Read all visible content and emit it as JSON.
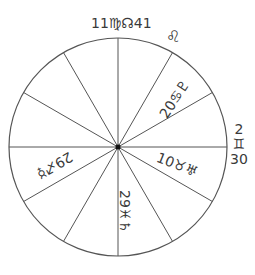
{
  "chart": {
    "center": [
      118,
      147
    ],
    "radius": 109,
    "spoke_count": 12,
    "line_color": "#555555"
  },
  "labels": {
    "top": "11♍☊41",
    "top_right_sign": "♌",
    "upper_right_sector": "20♋♇",
    "right_top": "2",
    "right_sign": "♊",
    "right_bottom": "30",
    "lower_right_sector": "10♉♅",
    "bottom_sector": "29♓♄",
    "lower_left_sector": "29♐☿"
  }
}
